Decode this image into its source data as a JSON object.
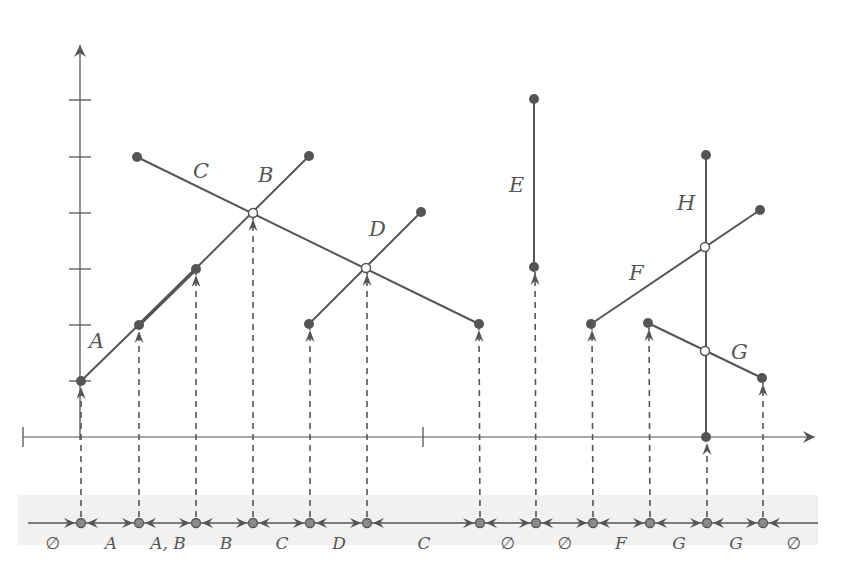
{
  "figure": {
    "colors": {
      "line": "#555555",
      "point_fill": "#555555",
      "open_point_fill": "#ffffff",
      "dashed": "#555555",
      "band": "#f1f1f1"
    },
    "y_axis": {
      "x": 80,
      "y_top": 45,
      "y_bottom": 440,
      "ticks_y": [
        100,
        157,
        213,
        269,
        325,
        381
      ]
    },
    "x_axis": {
      "y": 437,
      "x_start": 23,
      "x_end": 815,
      "ticks_x": [
        23,
        423
      ]
    },
    "segments": [
      {
        "label": "A",
        "x1": 81,
        "y1": 381,
        "x2": 196,
        "y2": 269,
        "label_x": 89,
        "label_y": 348
      },
      {
        "label": "B",
        "x1": 139,
        "y1": 325,
        "x2": 309,
        "y2": 156,
        "label_x": 258,
        "label_y": 182
      },
      {
        "label": "C",
        "x1": 137,
        "y1": 157,
        "x2": 479,
        "y2": 324,
        "label_x": 193,
        "label_y": 178
      },
      {
        "label": "D",
        "x1": 309,
        "y1": 324,
        "x2": 421,
        "y2": 212,
        "label_x": 369,
        "label_y": 236
      },
      {
        "label": "E",
        "x1": 534,
        "y1": 99,
        "x2": 534,
        "y2": 267,
        "label_x": 509,
        "label_y": 192
      },
      {
        "label": "F",
        "x1": 591,
        "y1": 324,
        "x2": 760,
        "y2": 210,
        "label_x": 629,
        "label_y": 280
      },
      {
        "label": "G",
        "x1": 648,
        "y1": 323,
        "x2": 762,
        "y2": 378,
        "label_x": 731,
        "label_y": 359
      },
      {
        "label": "H",
        "x1": 706,
        "y1": 155,
        "x2": 706,
        "y2": 437,
        "label_x": 677,
        "label_y": 210
      }
    ],
    "thick_overlap": {
      "x1": 139,
      "y1": 325,
      "x2": 196,
      "y2": 269
    },
    "open_points": [
      {
        "x": 253,
        "y": 213
      },
      {
        "x": 366,
        "y": 268
      },
      {
        "x": 705,
        "y": 247
      },
      {
        "x": 705,
        "y": 351
      }
    ],
    "event_points": [
      {
        "x": 81,
        "y": 381
      },
      {
        "x": 139,
        "y": 325
      },
      {
        "x": 196,
        "y": 269
      },
      {
        "x": 253,
        "y": 213
      },
      {
        "x": 310,
        "y": 324
      },
      {
        "x": 367,
        "y": 268
      },
      {
        "x": 479,
        "y": 324
      },
      {
        "x": 535,
        "y": 267
      },
      {
        "x": 592,
        "y": 324
      },
      {
        "x": 649,
        "y": 323
      },
      {
        "x": 707,
        "y": 437
      },
      {
        "x": 763,
        "y": 378
      }
    ],
    "bottom_line": {
      "y": 523,
      "x_start": 28,
      "x_end": 818,
      "points_x": [
        81,
        139,
        196,
        253,
        310,
        367,
        480,
        536,
        593,
        650,
        707,
        763
      ],
      "interval_labels": [
        {
          "text": "∅",
          "x": 53,
          "kind": "empty"
        },
        {
          "text": "A",
          "x": 111,
          "kind": "set"
        },
        {
          "text": "A, B",
          "x": 168,
          "kind": "set"
        },
        {
          "text": "B",
          "x": 226,
          "kind": "set"
        },
        {
          "text": "C",
          "x": 282,
          "kind": "set"
        },
        {
          "text": "D",
          "x": 339,
          "kind": "set"
        },
        {
          "text": "C",
          "x": 424,
          "kind": "set"
        },
        {
          "text": "∅",
          "x": 508,
          "kind": "empty"
        },
        {
          "text": "∅",
          "x": 565,
          "kind": "empty"
        },
        {
          "text": "F",
          "x": 621,
          "kind": "set"
        },
        {
          "text": "G",
          "x": 679,
          "kind": "set"
        },
        {
          "text": "G",
          "x": 736,
          "kind": "set"
        },
        {
          "text": "∅",
          "x": 794,
          "kind": "empty"
        }
      ],
      "label_y": 549
    }
  }
}
